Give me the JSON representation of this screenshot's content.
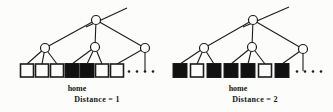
{
  "figure": {
    "background": "#fcfcfa",
    "ink_color": "#1c1c1c",
    "node_fill": "#fcfcfa",
    "leaf_filled_color": "#111111",
    "leaf_empty_color": "#fcfcfa",
    "trees": [
      {
        "id": "tree-distance-1",
        "caption": "Distance = 1",
        "home_label": "home",
        "parent_edge": {
          "x1": 86,
          "y1": 27,
          "x2": 127,
          "y2": 8
        },
        "root": {
          "x": 96,
          "y": 20
        },
        "children": [
          {
            "x": 45,
            "y": 48,
            "leaf_indices": [
              0,
              1,
              2
            ]
          },
          {
            "x": 95,
            "y": 47,
            "leaf_indices": [
              3,
              4,
              5
            ]
          },
          {
            "x": 145,
            "y": 48,
            "leaf_indices": [
              6
            ]
          }
        ],
        "vertical_edge": {
          "x": 145,
          "y1": 52,
          "y2": 71
        },
        "leaf_y": 64,
        "leaf_size": 13,
        "leaves": [
          {
            "cx": 27,
            "filled": false
          },
          {
            "cx": 42,
            "filled": false
          },
          {
            "cx": 57,
            "filled": false
          },
          {
            "cx": 72,
            "filled": true
          },
          {
            "cx": 87,
            "filled": true
          },
          {
            "cx": 102,
            "filled": false
          },
          {
            "cx": 117,
            "filled": false
          }
        ],
        "dots": {
          "y": 71.5,
          "xs": [
            129,
            137,
            145,
            153
          ]
        }
      },
      {
        "id": "tree-distance-2",
        "caption": "Distance = 2",
        "home_label": "home",
        "parent_edge": {
          "x1": 243,
          "y1": 27,
          "x2": 289,
          "y2": 7
        },
        "root": {
          "x": 253,
          "y": 20
        },
        "children": [
          {
            "x": 204,
            "y": 48,
            "leaf_indices": [
              0,
              1,
              2
            ]
          },
          {
            "x": 252,
            "y": 47,
            "leaf_indices": [
              3,
              4,
              5
            ]
          },
          {
            "x": 303,
            "y": 49,
            "leaf_indices": [
              6
            ]
          }
        ],
        "vertical_edge": {
          "x": 303,
          "y1": 53,
          "y2": 71
        },
        "leaf_y": 64,
        "leaf_size": 13,
        "leaves": [
          {
            "cx": 180,
            "filled": true
          },
          {
            "cx": 197,
            "filled": false
          },
          {
            "cx": 214,
            "filled": true
          },
          {
            "cx": 231,
            "filled": true
          },
          {
            "cx": 248,
            "filled": true
          },
          {
            "cx": 265,
            "filled": false
          },
          {
            "cx": 282,
            "filled": true
          }
        ],
        "dots": {
          "y": 71.5,
          "xs": [
            297,
            305,
            313,
            321
          ]
        }
      }
    ]
  }
}
